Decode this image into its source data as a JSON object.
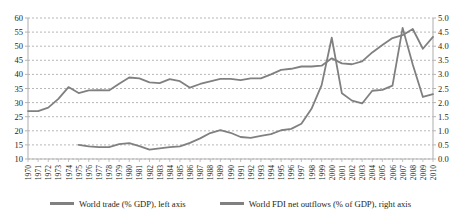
{
  "chart_data": {
    "type": "line",
    "title": "",
    "xlabel": "",
    "grid": true,
    "legend_position": "bottom",
    "x": [
      1970,
      1971,
      1972,
      1973,
      1974,
      1975,
      1976,
      1977,
      1978,
      1979,
      1980,
      1981,
      1982,
      1983,
      1984,
      1985,
      1986,
      1987,
      1988,
      1989,
      1990,
      1991,
      1992,
      1993,
      1994,
      1995,
      1996,
      1997,
      1998,
      1999,
      2000,
      2001,
      2002,
      2003,
      2004,
      2005,
      2006,
      2007,
      2008,
      2009,
      2010
    ],
    "xtick_labels": [
      "1970",
      "1971",
      "1972",
      "1973",
      "1974",
      "1975",
      "1976",
      "1977",
      "1978",
      "1979",
      "1980",
      "1981",
      "1982",
      "1983",
      "1984",
      "1985",
      "1986",
      "1987",
      "1988",
      "1989",
      "1990",
      "1991",
      "1992",
      "1993",
      "1994",
      "1995",
      "1996",
      "1997",
      "1998",
      "1999",
      "2000",
      "2001",
      "2002",
      "2003",
      "2004",
      "2005",
      "2006",
      "2007",
      "2008",
      "2009",
      "2010"
    ],
    "left_axis": {
      "label": "",
      "ylim": [
        10,
        60
      ],
      "ticks": [
        10,
        15,
        20,
        25,
        30,
        35,
        40,
        45,
        50,
        55,
        60
      ],
      "tick_labels": [
        "10",
        "15",
        "20",
        "25",
        "30",
        "35",
        "40",
        "45",
        "50",
        "55",
        "60"
      ]
    },
    "right_axis": {
      "label": "",
      "ylim": [
        0.0,
        5.0
      ],
      "ticks": [
        0.0,
        0.5,
        1.0,
        1.5,
        2.0,
        2.5,
        3.0,
        3.5,
        4.0,
        4.5,
        5.0
      ],
      "tick_labels": [
        "0.0",
        "0.5",
        "1.0",
        "1.5",
        "2.0",
        "2.5",
        "3.0",
        "3.5",
        "4.0",
        "4.5",
        "5.0"
      ]
    },
    "series": [
      {
        "name": "World trade (% GDP), left axis",
        "axis": "left",
        "color": "#808080",
        "x": [
          1970,
          1971,
          1972,
          1973,
          1974,
          1975,
          1976,
          1977,
          1978,
          1979,
          1980,
          1981,
          1982,
          1983,
          1984,
          1985,
          1986,
          1987,
          1988,
          1989,
          1990,
          1991,
          1992,
          1993,
          1994,
          1995,
          1996,
          1997,
          1998,
          1999,
          2000,
          2001,
          2002,
          2003,
          2004,
          2005,
          2006,
          2007,
          2008,
          2009,
          2010
        ],
        "values": [
          27.0,
          27.0,
          28.2,
          31.3,
          35.5,
          33.4,
          34.3,
          34.4,
          34.3,
          36.7,
          38.9,
          38.6,
          37.2,
          36.9,
          38.3,
          37.6,
          35.3,
          36.6,
          37.5,
          38.4,
          38.4,
          38.0,
          38.6,
          38.6,
          40.0,
          41.6,
          42.0,
          42.8,
          42.8,
          43.1,
          45.7,
          43.9,
          43.6,
          44.6,
          47.8,
          50.4,
          52.9,
          53.9,
          56.1,
          49.1,
          53.3
        ]
      },
      {
        "name": "World FDI net outflows (% of GDP), right axis",
        "axis": "right",
        "color": "#808080",
        "x": [
          1975,
          1976,
          1977,
          1978,
          1979,
          1980,
          1981,
          1982,
          1983,
          1984,
          1985,
          1986,
          1987,
          1988,
          1989,
          1990,
          1991,
          1992,
          1993,
          1994,
          1995,
          1996,
          1997,
          1998,
          1999,
          2000,
          2001,
          2002,
          2003,
          2004,
          2005,
          2006,
          2007,
          2008,
          2009,
          2010
        ],
        "values": [
          0.5,
          0.45,
          0.42,
          0.42,
          0.53,
          0.56,
          0.46,
          0.33,
          0.38,
          0.42,
          0.45,
          0.57,
          0.73,
          0.92,
          1.02,
          0.93,
          0.78,
          0.75,
          0.82,
          0.88,
          1.02,
          1.07,
          1.25,
          1.78,
          2.62,
          4.3,
          2.33,
          2.07,
          1.97,
          2.42,
          2.45,
          2.6,
          4.65,
          3.35,
          2.2,
          2.3
        ]
      }
    ]
  },
  "legend": {
    "items": [
      {
        "label": "World trade (% GDP), left axis",
        "color": "#808080"
      },
      {
        "label": "World FDI net outflows (% of GDP), right axis",
        "color": "#808080"
      }
    ]
  },
  "colors": {
    "line": "#808080",
    "grid": "#9a9a9a",
    "axis": "#b5b5b5",
    "text": "#231f20",
    "background": "#ffffff"
  }
}
